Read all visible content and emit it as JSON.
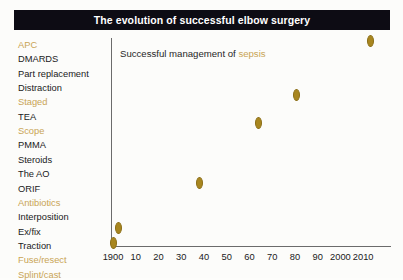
{
  "title": "The evolution of successful elbow surgery",
  "annotation": {
    "prefix": "Successful management of ",
    "accent": "sepsis"
  },
  "colors": {
    "banner_background": "#0d0c14",
    "banner_text": "#ffffff",
    "marker": "#a8861f",
    "accent_label": "#c9a455",
    "plain_label": "#1a1a1a",
    "axis": "#6b6b6b",
    "page_background": "#fcfcfa"
  },
  "chart_data": {
    "type": "scatter",
    "title": "The evolution of successful elbow surgery",
    "xlabel": "",
    "ylabel": "",
    "grid": false,
    "legend": "none",
    "xlim": [
      1895,
      2015
    ],
    "x_ticks": [
      {
        "value": 1900,
        "label": "1900"
      },
      {
        "value": 1910,
        "label": "10"
      },
      {
        "value": 1920,
        "label": "20"
      },
      {
        "value": 1930,
        "label": "30"
      },
      {
        "value": 1940,
        "label": "40"
      },
      {
        "value": 1950,
        "label": "50"
      },
      {
        "value": 1960,
        "label": "60"
      },
      {
        "value": 1970,
        "label": "70"
      },
      {
        "value": 1980,
        "label": "80"
      },
      {
        "value": 1990,
        "label": "90"
      },
      {
        "value": 2000,
        "label": "2000"
      },
      {
        "value": 2010,
        "label": "2010"
      }
    ],
    "y_categories": [
      {
        "label": "APC",
        "accent": true
      },
      {
        "label": "DMARDS",
        "accent": false
      },
      {
        "label": "Part replacement",
        "accent": false
      },
      {
        "label": "Distraction",
        "accent": false
      },
      {
        "label": "Staged",
        "accent": true
      },
      {
        "label": "TEA",
        "accent": false
      },
      {
        "label": "Scope",
        "accent": true
      },
      {
        "label": "PMMA",
        "accent": false
      },
      {
        "label": "Steroids",
        "accent": false
      },
      {
        "label": "The AO",
        "accent": false
      },
      {
        "label": "ORIF",
        "accent": false
      },
      {
        "label": "Antibiotics",
        "accent": true
      },
      {
        "label": "Interposition",
        "accent": false
      },
      {
        "label": "Ex/fix",
        "accent": false
      },
      {
        "label": "Traction",
        "accent": false
      },
      {
        "label": "Fuse/resect",
        "accent": true
      },
      {
        "label": "Splint/cast",
        "accent": true
      }
    ],
    "points": [
      {
        "x": 1900,
        "y_label": "Splint/cast",
        "px": 113,
        "py": 243
      },
      {
        "x": 1905,
        "y_label": "Fuse/resect",
        "px": 118,
        "py": 228
      },
      {
        "x": 1943,
        "y_label": "Antibiotics",
        "px": 199,
        "py": 183
      },
      {
        "x": 1965,
        "y_label": "Scope",
        "px": 258,
        "py": 123
      },
      {
        "x": 1983,
        "y_label": "Staged",
        "px": 296,
        "py": 95
      },
      {
        "x": 2013,
        "y_label": "APC",
        "px": 370,
        "py": 41
      }
    ]
  }
}
